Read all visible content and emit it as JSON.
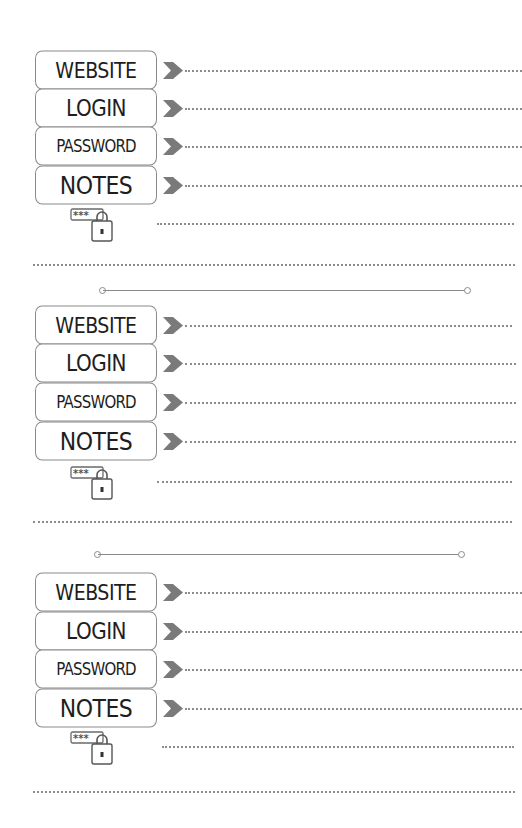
{
  "page": {
    "background": "#ffffff",
    "line_color": "#8c8c8c",
    "chevron_color": "#7a7a7a"
  },
  "entries": [
    {
      "fields": [
        {
          "label": "WEBSITE",
          "value": ""
        },
        {
          "label": "LOGIN",
          "value": ""
        },
        {
          "label": "PASSWORD",
          "value": ""
        },
        {
          "label": "NOTES",
          "value": ""
        }
      ],
      "lock_icon": "password-lock-icon",
      "lock_icon_text": "***"
    },
    {
      "fields": [
        {
          "label": "WEBSITE",
          "value": ""
        },
        {
          "label": "LOGIN",
          "value": ""
        },
        {
          "label": "PASSWORD",
          "value": ""
        },
        {
          "label": "NOTES",
          "value": ""
        }
      ],
      "lock_icon": "password-lock-icon",
      "lock_icon_text": "***"
    },
    {
      "fields": [
        {
          "label": "WEBSITE",
          "value": ""
        },
        {
          "label": "LOGIN",
          "value": ""
        },
        {
          "label": "PASSWORD",
          "value": ""
        },
        {
          "label": "NOTES",
          "value": ""
        }
      ],
      "lock_icon": "password-lock-icon",
      "lock_icon_text": "***"
    }
  ]
}
